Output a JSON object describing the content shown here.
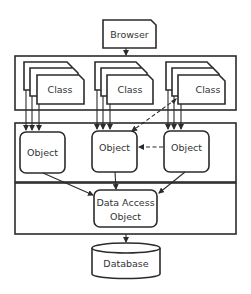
{
  "diagram": {
    "type": "layered-architecture",
    "colors": {
      "line": "#2b2b2b",
      "fill": "#ffffff",
      "text": "#333333"
    },
    "nodes": {
      "browser": {
        "label": "Browser"
      },
      "classes": [
        {
          "label": "Class"
        },
        {
          "label": "Class"
        },
        {
          "label": "Class"
        }
      ],
      "objects": [
        {
          "label": "Object"
        },
        {
          "label": "Object"
        },
        {
          "label": "Object"
        }
      ],
      "dao": {
        "line1": "Data Access",
        "line2": "Object"
      },
      "database": {
        "label": "Database"
      }
    },
    "layers": [
      "class-layer",
      "object-layer",
      "data-access-layer"
    ],
    "edges": [
      {
        "from": "browser",
        "to": "class-layer",
        "style": "solid"
      },
      {
        "from": "class-1",
        "to": "object-1",
        "style": "solid",
        "count": 3
      },
      {
        "from": "class-2",
        "to": "object-2",
        "style": "solid",
        "count": 3
      },
      {
        "from": "class-3",
        "to": "object-3",
        "style": "solid",
        "count": 3
      },
      {
        "from": "object-2",
        "to": "class-3",
        "style": "dashed"
      },
      {
        "from": "object-3",
        "to": "object-2",
        "style": "dashed"
      },
      {
        "from": "object-1",
        "to": "dao",
        "style": "solid"
      },
      {
        "from": "object-2",
        "to": "dao",
        "style": "solid"
      },
      {
        "from": "object-3",
        "to": "dao",
        "style": "solid"
      },
      {
        "from": "data-access-layer",
        "to": "database",
        "style": "solid"
      }
    ]
  }
}
